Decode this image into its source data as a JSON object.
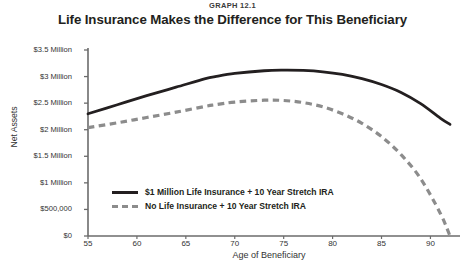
{
  "header": {
    "graph_number": "GRAPH 12.1",
    "title": "Life Insurance Makes the Difference for This Beneficiary"
  },
  "colors": {
    "solid_series": "#231f20",
    "dashed_series": "#8c8c8c",
    "axis": "#6b6b6b",
    "text": "#333333"
  },
  "chart_data": {
    "type": "line",
    "title": "Life Insurance Makes the Difference for This Beneficiary",
    "subtitle": "GRAPH 12.1",
    "xlabel": "Age of Beneficiary",
    "ylabel": "Net Assets",
    "xlim": [
      55,
      92
    ],
    "ylim": [
      0,
      3500000
    ],
    "xticks": [
      55,
      60,
      65,
      70,
      75,
      80,
      85,
      90
    ],
    "xticklabels": [
      "55",
      "60",
      "65",
      "70",
      "75",
      "80",
      "85",
      "90"
    ],
    "yticks": [
      0,
      500000,
      1000000,
      1500000,
      2000000,
      2500000,
      3000000,
      3500000
    ],
    "yticklabels": [
      "$0",
      "$500,000",
      "$1 Million",
      "$1.5 Million",
      "$2 Million",
      "$2.5 Million",
      "$3 Million",
      "$3.5 Million"
    ],
    "grid": false,
    "legend_position": "inside-lower-left",
    "x": [
      55,
      58,
      61,
      64,
      67,
      68,
      70,
      73,
      75,
      77,
      79,
      81,
      83,
      85,
      87,
      89,
      91,
      92
    ],
    "series": [
      {
        "name": "$1 Million Life Insurance + 10 Year Stretch IRA",
        "style": "solid",
        "color": "#231f20",
        "values": [
          2300000,
          2470000,
          2640000,
          2800000,
          2960000,
          3000000,
          3060000,
          3110000,
          3120000,
          3115000,
          3090000,
          3040000,
          2960000,
          2850000,
          2700000,
          2490000,
          2220000,
          2100000
        ]
      },
      {
        "name": "No Life Insurance + 10 Year Stretch IRA",
        "style": "dashed",
        "color": "#8c8c8c",
        "values": [
          2040000,
          2130000,
          2230000,
          2330000,
          2440000,
          2470000,
          2520000,
          2555000,
          2550000,
          2510000,
          2430000,
          2300000,
          2120000,
          1870000,
          1530000,
          1080000,
          430000,
          0
        ]
      }
    ]
  }
}
